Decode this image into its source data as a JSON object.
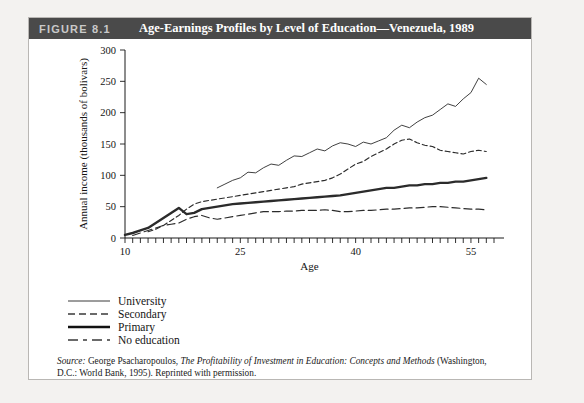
{
  "figure": {
    "number": "FIGURE 8.1",
    "title": "Age-Earnings Profiles by Level of Education—Venezuela, 1989"
  },
  "source": {
    "label": "Source:",
    "text_before_italic": " George Psacharopoulos, ",
    "italic_text": "The Profitability of Investment in Education: Concepts and Methods",
    "text_after_italic": " (Washington, D.C.: World Bank, 1995). Reprinted with permission."
  },
  "legend": {
    "items": [
      {
        "label": "University",
        "style": "thin-solid"
      },
      {
        "label": "Secondary",
        "style": "short-dash"
      },
      {
        "label": "Primary",
        "style": "thick-solid"
      },
      {
        "label": "No education",
        "style": "long-dash"
      }
    ]
  },
  "chart_data": {
    "type": "line",
    "title": "Age-Earnings Profiles by Level of Education—Venezuela, 1989",
    "xlabel": "Age",
    "ylabel": "Annual income (thousands of bolivars)",
    "xlim": [
      10,
      58
    ],
    "ylim": [
      0,
      300
    ],
    "yticks": [
      0,
      50,
      100,
      150,
      200,
      250,
      300
    ],
    "xticks_labeled": [
      10,
      25,
      40,
      55
    ],
    "xtick_step": 1,
    "grid": false,
    "legend_position": "below-left",
    "series": [
      {
        "name": "University",
        "style": "thin-solid",
        "x": [
          22,
          23,
          24,
          25,
          26,
          27,
          28,
          29,
          30,
          31,
          32,
          33,
          34,
          35,
          36,
          37,
          38,
          39,
          40,
          41,
          42,
          43,
          44,
          45,
          46,
          47,
          48,
          49,
          50,
          51,
          52,
          53,
          54,
          55,
          56,
          57
        ],
        "values": [
          80,
          86,
          92,
          96,
          105,
          104,
          112,
          118,
          116,
          124,
          131,
          130,
          136,
          142,
          139,
          147,
          152,
          150,
          146,
          153,
          150,
          155,
          160,
          172,
          180,
          176,
          185,
          192,
          196,
          205,
          214,
          210,
          222,
          232,
          255,
          245
        ]
      },
      {
        "name": "Secondary",
        "style": "short-dash",
        "x": [
          13,
          14,
          15,
          16,
          17,
          18,
          19,
          20,
          21,
          22,
          23,
          24,
          25,
          26,
          27,
          28,
          29,
          30,
          31,
          32,
          33,
          34,
          35,
          36,
          37,
          38,
          39,
          40,
          41,
          42,
          43,
          44,
          45,
          46,
          47,
          48,
          49,
          50,
          51,
          52,
          53,
          54,
          55,
          56,
          57
        ],
        "values": [
          10,
          14,
          20,
          28,
          36,
          46,
          54,
          58,
          60,
          62,
          64,
          66,
          68,
          70,
          72,
          74,
          76,
          78,
          80,
          82,
          86,
          88,
          90,
          92,
          96,
          102,
          110,
          118,
          122,
          130,
          136,
          142,
          150,
          156,
          158,
          152,
          148,
          146,
          140,
          138,
          136,
          134,
          138,
          140,
          138
        ],
        "peak": {
          "age": 47,
          "value": 158
        }
      },
      {
        "name": "Primary",
        "style": "thick-solid",
        "x": [
          10,
          11,
          12,
          13,
          14,
          15,
          16,
          17,
          18,
          19,
          20,
          21,
          22,
          23,
          24,
          25,
          26,
          27,
          28,
          29,
          30,
          31,
          32,
          33,
          34,
          35,
          36,
          37,
          38,
          39,
          40,
          41,
          42,
          43,
          44,
          45,
          46,
          47,
          48,
          49,
          50,
          51,
          52,
          53,
          54,
          55,
          56,
          57
        ],
        "values": [
          5,
          8,
          12,
          16,
          24,
          32,
          40,
          48,
          38,
          40,
          46,
          48,
          50,
          52,
          54,
          55,
          56,
          57,
          58,
          59,
          60,
          61,
          62,
          63,
          64,
          65,
          66,
          67,
          68,
          70,
          72,
          74,
          76,
          78,
          80,
          80,
          82,
          84,
          84,
          86,
          86,
          88,
          88,
          90,
          90,
          92,
          94,
          96
        ]
      },
      {
        "name": "No education",
        "style": "long-dash",
        "x": [
          11,
          12,
          13,
          14,
          15,
          16,
          17,
          18,
          19,
          20,
          21,
          22,
          23,
          24,
          25,
          26,
          27,
          28,
          29,
          30,
          31,
          32,
          33,
          34,
          35,
          36,
          37,
          38,
          39,
          40,
          41,
          42,
          43,
          44,
          45,
          46,
          47,
          48,
          49,
          50,
          51,
          52,
          53,
          54,
          55,
          56,
          57
        ],
        "values": [
          4,
          8,
          12,
          16,
          20,
          22,
          24,
          30,
          34,
          36,
          32,
          30,
          32,
          34,
          36,
          38,
          40,
          42,
          42,
          42,
          43,
          43,
          44,
          44,
          44,
          45,
          44,
          42,
          42,
          43,
          44,
          44,
          45,
          46,
          46,
          47,
          48,
          48,
          49,
          50,
          50,
          49,
          48,
          47,
          46,
          46,
          45
        ]
      }
    ]
  }
}
